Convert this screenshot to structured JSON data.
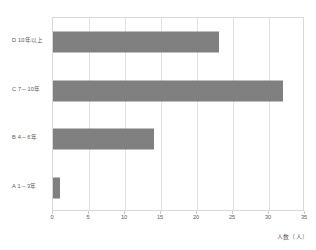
{
  "chart_data": {
    "type": "bar",
    "orientation": "horizontal",
    "title": "",
    "xlabel": "人数（人）",
    "ylabel": "",
    "categories": [
      "A 1－3年",
      "B 4－6年",
      "C 7－10年",
      "D 10年以上"
    ],
    "values": [
      1,
      14,
      32,
      23
    ],
    "xlim": [
      0,
      35
    ],
    "xticks": [
      "0",
      "5",
      "10",
      "15",
      "20",
      "25",
      "30",
      "35"
    ],
    "xtick_values": [
      0,
      5,
      10,
      15,
      20,
      25,
      30,
      35
    ],
    "grid": true,
    "legend": false,
    "bar_color": "#808080",
    "grid_color": "#e2e2e2",
    "frame_color": "#d8d8d8",
    "text_color": "#5a5a5a"
  }
}
